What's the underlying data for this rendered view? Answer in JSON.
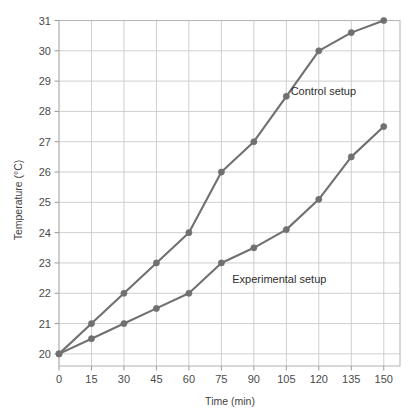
{
  "chart_data": {
    "type": "line",
    "title": "",
    "xlabel": "Time (min)",
    "ylabel": "Temperature (°C)",
    "x": [
      0,
      15,
      30,
      45,
      60,
      75,
      90,
      105,
      120,
      135,
      150
    ],
    "xtick_labels": [
      "0",
      "15",
      "30",
      "45",
      "60",
      "75",
      "90",
      "105",
      "120",
      "135",
      "150"
    ],
    "ytick_labels": [
      "20",
      "21",
      "22",
      "23",
      "24",
      "25",
      "26",
      "27",
      "28",
      "29",
      "30",
      "31"
    ],
    "yticks": [
      20,
      21,
      22,
      23,
      24,
      25,
      26,
      27,
      28,
      29,
      30,
      31
    ],
    "xlim": [
      0,
      157.5
    ],
    "ylim": [
      19.6,
      31.0
    ],
    "grid": true,
    "legend_position": "inline-annotations",
    "series": [
      {
        "name": "Control setup",
        "color": "#707070",
        "marker": "circle",
        "values": [
          20,
          21,
          22,
          23,
          24,
          26,
          27,
          28.5,
          30,
          30.6,
          31
        ],
        "annotation": {
          "text": "Control setup",
          "x": 107,
          "y": 28.55
        }
      },
      {
        "name": "Experimental setup",
        "color": "#707070",
        "marker": "circle",
        "values": [
          20,
          20.5,
          21,
          21.5,
          22,
          23,
          23.5,
          24.1,
          25.1,
          26.5,
          27.5
        ],
        "annotation": {
          "text": "Experimental setup",
          "x": 80,
          "y": 22.35
        }
      }
    ]
  },
  "axes": {
    "grid_color": "#c9c9c9",
    "frame_color": "#b8b8b8",
    "tick_color": "#9a9a9a",
    "background": "#ffffff"
  }
}
